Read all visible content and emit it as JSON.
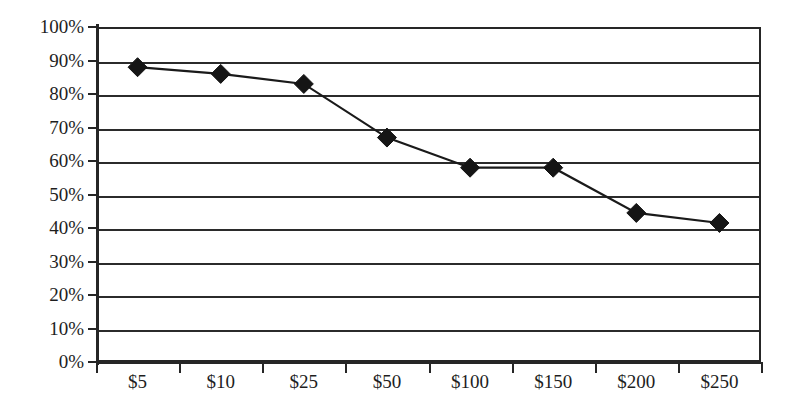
{
  "chart_data": {
    "type": "line",
    "title": "",
    "subtitle": "",
    "xlabel": "",
    "ylabel": "",
    "categories": [
      "$5",
      "$10",
      "$25",
      "$50",
      "$100",
      "$150",
      "$200",
      "$250"
    ],
    "values": [
      88,
      86,
      83,
      67,
      58,
      58,
      44.5,
      41.5
    ],
    "value_labels": [
      "88%",
      "86%",
      "83%",
      "67%",
      "58%",
      "58%",
      "44%",
      "41%"
    ],
    "series": [
      {
        "name": "",
        "values": [
          88,
          86,
          83,
          67,
          58,
          58,
          44.5,
          41.5
        ],
        "color": "#151515",
        "marker": "diamond"
      }
    ],
    "ylim": [
      0,
      100
    ],
    "yticks": [
      0,
      10,
      20,
      30,
      40,
      50,
      60,
      70,
      80,
      90,
      100
    ],
    "ytick_labels": [
      "0%",
      "10%",
      "20%",
      "30%",
      "40%",
      "50%",
      "60%",
      "70%",
      "80%",
      "90%",
      "100%"
    ],
    "grid": true,
    "grid_axis": "y",
    "legend": false,
    "legend_position": "none",
    "axis_color": "#262626",
    "grid_color": "#2b2b2b",
    "background_color": "#ffffff"
  }
}
